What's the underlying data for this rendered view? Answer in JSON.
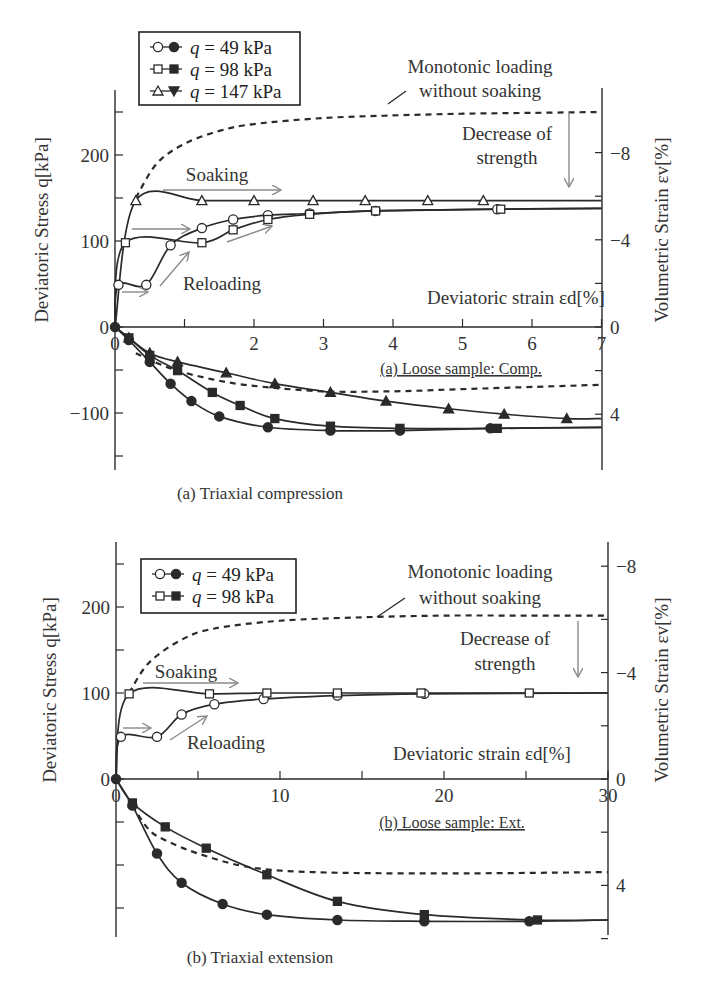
{
  "chart_data": [
    {
      "id": "a",
      "type": "line",
      "title": "(a) Loose sample: Comp.",
      "caption": "(a) Triaxial compression",
      "xlabel": "Deviatoric strain εd[%]",
      "ylabel_left": "Deviatoric Stress q[kPa]",
      "ylabel_right": "Volumetric Strain εv[%]",
      "xlim": [
        0,
        7
      ],
      "x_ticks": [
        "0",
        "2",
        "3",
        "4",
        "5",
        "6",
        "7"
      ],
      "ylim_left": [
        -150,
        250
      ],
      "y_ticks_left": [
        "200",
        "100",
        "0",
        "-100"
      ],
      "y_ticks_right": [
        "-8",
        "-4",
        "0",
        "4"
      ],
      "legend": [
        "q = 49 kPa",
        "q = 98 kPa",
        "q = 147 kPa"
      ],
      "annotations": [
        "Monotonic loading without soaking",
        "Decrease of strength",
        "Soaking",
        "Reloading"
      ],
      "series": [
        {
          "name": "q = 49 kPa (stress)",
          "x": [
            0,
            0.05,
            0.45,
            0.8,
            1.25,
            1.7,
            2.2,
            2.8,
            3.75,
            5.5,
            7.0
          ],
          "q": [
            0,
            49,
            49,
            95,
            115,
            125,
            130,
            132,
            135,
            137,
            138
          ]
        },
        {
          "name": "q = 98 kPa (stress)",
          "x": [
            0,
            0.15,
            1.25,
            1.7,
            2.2,
            2.8,
            3.75,
            5.55,
            7.0
          ],
          "q": [
            0,
            98,
            98,
            113,
            125,
            131,
            135,
            137,
            138
          ]
        },
        {
          "name": "q = 147 kPa (stress)",
          "x": [
            0,
            0.3,
            1.25,
            2.0,
            2.85,
            3.6,
            4.5,
            5.3,
            7.0
          ],
          "q": [
            0,
            147,
            147,
            147,
            147,
            147,
            147,
            147,
            147
          ]
        },
        {
          "name": "Monotonic (stress)",
          "x": [
            0.3,
            0.6,
            1,
            1.5,
            2,
            3,
            4,
            5,
            6,
            7
          ],
          "q": [
            150,
            190,
            213,
            228,
            236,
            243,
            246,
            248,
            249,
            250
          ]
        },
        {
          "name": "q = 49 kPa (volumetric)",
          "x": [
            0,
            0.2,
            0.5,
            0.8,
            1.1,
            1.5,
            2.2,
            3.1,
            4.1,
            5.4,
            7.0
          ],
          "ev": [
            0,
            0.6,
            1.6,
            2.6,
            3.4,
            4.1,
            4.6,
            4.75,
            4.75,
            4.65,
            4.6
          ]
        },
        {
          "name": "q = 98 kPa (volumetric)",
          "x": [
            0,
            0.2,
            0.5,
            0.9,
            1.4,
            1.8,
            2.3,
            3.1,
            4.1,
            5.5,
            7.0
          ],
          "ev": [
            0,
            0.5,
            1.3,
            2.0,
            3.0,
            3.6,
            4.2,
            4.55,
            4.65,
            4.65,
            4.6
          ]
        },
        {
          "name": "q = 147 kPa (volumetric)",
          "x": [
            0,
            0.2,
            0.5,
            0.9,
            1.6,
            2.3,
            3.1,
            3.9,
            4.8,
            5.6,
            6.5,
            7.0
          ],
          "ev": [
            0,
            0.5,
            1.2,
            1.6,
            2.1,
            2.6,
            3.0,
            3.4,
            3.75,
            4.0,
            4.2,
            4.2
          ]
        },
        {
          "name": "Monotonic (volumetric)",
          "x": [
            0.3,
            0.8,
            1.4,
            2,
            3,
            4,
            5,
            6,
            7
          ],
          "ev": [
            1.2,
            1.9,
            2.4,
            2.7,
            2.95,
            2.95,
            2.85,
            2.75,
            2.65
          ]
        }
      ]
    },
    {
      "id": "b",
      "type": "line",
      "title": "(b) Loose sample: Ext.",
      "caption": "(b) Triaxial extension",
      "xlabel": "Deviatoric strain εd[%]",
      "ylabel_left": "Deviatoric Stress q[kPa]",
      "ylabel_right": "Volumetric Strain εv[%]",
      "xlim": [
        0,
        30
      ],
      "x_ticks": [
        "0",
        "10",
        "20",
        "30"
      ],
      "ylim_left": [
        -180,
        270
      ],
      "y_ticks_left": [
        "200",
        "100",
        "0"
      ],
      "y_ticks_right": [
        "-8",
        "-4",
        "0",
        "4"
      ],
      "legend": [
        "q = 49 kPa",
        "q = 98 kPa"
      ],
      "annotations": [
        "Monotonic loading without soaking",
        "Decrease of strength",
        "Soaking",
        "Reloading"
      ],
      "series": [
        {
          "name": "q = 49 kPa (stress)",
          "x": [
            0,
            0.3,
            2.5,
            4.0,
            6.0,
            9.0,
            13.5,
            18.8,
            30
          ],
          "q": [
            0,
            49,
            49,
            75,
            87,
            93,
            97,
            99,
            100
          ]
        },
        {
          "name": "q = 98 kPa (stress)",
          "x": [
            0,
            0.8,
            5.7,
            9.2,
            13.5,
            18.6,
            25.2,
            30
          ],
          "q": [
            0,
            99,
            99,
            100,
            100,
            100,
            100,
            100
          ]
        },
        {
          "name": "Monotonic (stress)",
          "x": [
            0.8,
            2,
            4,
            6,
            10,
            15,
            20,
            25,
            30
          ],
          "q": [
            100,
            135,
            162,
            175,
            184,
            188,
            190,
            190,
            190
          ]
        },
        {
          "name": "q = 49 kPa (volumetric)",
          "x": [
            0,
            1,
            2.5,
            4,
            6.5,
            9.2,
            13.5,
            18.8,
            25.2,
            30
          ],
          "ev": [
            0,
            1.0,
            2.8,
            3.9,
            4.7,
            5.1,
            5.3,
            5.35,
            5.35,
            5.3
          ]
        },
        {
          "name": "q = 98 kPa (volumetric)",
          "x": [
            0,
            1,
            3,
            5.5,
            9.2,
            13.5,
            18.8,
            25.7,
            30
          ],
          "ev": [
            0,
            0.9,
            1.8,
            2.6,
            3.6,
            4.6,
            5.1,
            5.3,
            5.3
          ]
        },
        {
          "name": "Monotonic (volumetric)",
          "x": [
            1,
            2,
            3,
            5,
            8,
            12,
            20,
            30
          ],
          "ev": [
            1.0,
            1.9,
            2.3,
            2.8,
            3.3,
            3.5,
            3.55,
            3.5
          ]
        }
      ]
    }
  ],
  "figure": {
    "panel_a": {
      "legend": [
        {
          "label_q": "q",
          "label_rest": " = 49 kPa",
          "marker": "circle"
        },
        {
          "label_q": "q",
          "label_rest": " = 98 kPa",
          "marker": "square"
        },
        {
          "label_q": "q",
          "label_rest": " = 147 kPa",
          "marker": "triangle"
        }
      ],
      "x_ticks": [
        {
          "v": 0,
          "label": "0"
        },
        {
          "v": 1,
          "label": ""
        },
        {
          "v": 2,
          "label": "2"
        },
        {
          "v": 3,
          "label": "3"
        },
        {
          "v": 4,
          "label": "4"
        },
        {
          "v": 5,
          "label": "5"
        },
        {
          "v": 6,
          "label": "6"
        },
        {
          "v": 7,
          "label": "7"
        }
      ],
      "left_ticks": [
        {
          "v": 250,
          "label": ""
        },
        {
          "v": 200,
          "label": "200"
        },
        {
          "v": 150,
          "label": ""
        },
        {
          "v": 100,
          "label": "100"
        },
        {
          "v": 0,
          "label": "0"
        },
        {
          "v": -100,
          "label": "−100"
        },
        {
          "v": -150,
          "label": ""
        },
        {
          "v": -50,
          "label": ""
        }
      ],
      "right_ticks": [
        {
          "v": -8,
          "label": "−8"
        },
        {
          "v": -6,
          "label": ""
        },
        {
          "v": -4,
          "label": "−4"
        },
        {
          "v": -2,
          "label": ""
        },
        {
          "v": 0,
          "label": "0"
        },
        {
          "v": 2,
          "label": ""
        },
        {
          "v": 4,
          "label": "4"
        }
      ],
      "ylabel_left": "Deviatoric Stress q[kPa]",
      "ylabel_right": "Volumetric Strain εv[%]",
      "xlabel": "Deviatoric strain εd[%]",
      "monotonic_label_1": "Monotonic loading",
      "monotonic_label_2": "without soaking",
      "decrease_label_1": "Decrease of",
      "decrease_label_2": "strength",
      "soaking_label": "Soaking",
      "reloading_label": "Reloading",
      "subtitle": "(a) Loose  sample: Comp.",
      "caption": "(a) Triaxial compression"
    },
    "panel_b": {
      "legend": [
        {
          "label_q": "q",
          "label_rest": " = 49 kPa",
          "marker": "circle"
        },
        {
          "label_q": "q",
          "label_rest": " = 98 kPa",
          "marker": "square"
        }
      ],
      "x_ticks": [
        {
          "v": 0,
          "label": "0"
        },
        {
          "v": 5,
          "label": ""
        },
        {
          "v": 10,
          "label": "10"
        },
        {
          "v": 15,
          "label": ""
        },
        {
          "v": 20,
          "label": "20"
        },
        {
          "v": 25,
          "label": ""
        },
        {
          "v": 30,
          "label": "30"
        }
      ],
      "left_ticks": [
        {
          "v": 250,
          "label": ""
        },
        {
          "v": 200,
          "label": "200"
        },
        {
          "v": 150,
          "label": ""
        },
        {
          "v": 100,
          "label": "100"
        },
        {
          "v": 0,
          "label": "0"
        },
        {
          "v": -50,
          "label": ""
        },
        {
          "v": -100,
          "label": ""
        },
        {
          "v": -150,
          "label": ""
        }
      ],
      "right_ticks": [
        {
          "v": -8,
          "label": "−8"
        },
        {
          "v": -6,
          "label": ""
        },
        {
          "v": -4,
          "label": "−4"
        },
        {
          "v": -2,
          "label": ""
        },
        {
          "v": 0,
          "label": "0"
        },
        {
          "v": 2,
          "label": ""
        },
        {
          "v": 4,
          "label": "4"
        },
        {
          "v": 6,
          "label": ""
        }
      ],
      "ylabel_left": "Deviatoric Stress q[kPa]",
      "ylabel_right": "Volumetric Strain εv[%]",
      "xlabel": "Deviatoric strain εd[%]",
      "monotonic_label_1": "Monotonic loading",
      "monotonic_label_2": "without soaking",
      "decrease_label_1": "Decrease of",
      "decrease_label_2": "strength",
      "soaking_label": "Soaking",
      "reloading_label": "Reloading",
      "subtitle": "(b) Loose sample: Ext.",
      "caption": "(b) Triaxial extension"
    }
  },
  "colors": {
    "line": "#2a2a2a",
    "arrow": "#8a8a8a",
    "text": "#333333"
  }
}
